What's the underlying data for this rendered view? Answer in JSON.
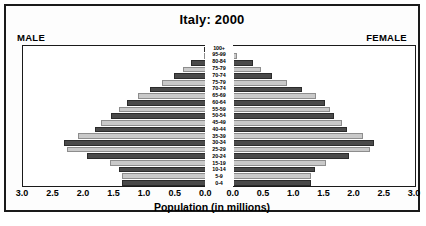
{
  "chart": {
    "title": "Italy: 2000",
    "male_label": "MALE",
    "female_label": "FEMALE",
    "xaxis_title": "Population (in millions)"
  },
  "chart_data": {
    "type": "bar",
    "subtype": "population-pyramid",
    "title": "Italy: 2000",
    "xlabel": "Population (in millions)",
    "ylabel": "",
    "xlim": [
      0,
      3.0
    ],
    "xtick_labels_left": [
      "3.0",
      "2.5",
      "2.0",
      "1.5",
      "1.0",
      "0.5",
      "0.0"
    ],
    "xtick_labels_right": [
      "0.0",
      "0.5",
      "1.0",
      "1.5",
      "2.0",
      "2.5",
      "3.0"
    ],
    "xtick_values": [
      3.0,
      2.5,
      2.0,
      1.5,
      1.0,
      0.5,
      0.0
    ],
    "grid": false,
    "legend": "none",
    "colors": {
      "dark_bar": "#4a4a4a",
      "light_bar": "#c9c9c9",
      "frame": "#1a1a1a",
      "background": "#ffffff"
    },
    "categories": [
      "100+",
      "95-99",
      "80-84",
      "75-79",
      "70-74",
      "75-79",
      "70-74",
      "65-69",
      "60-64",
      "55-59",
      "50-54",
      "45-49",
      "40-44",
      "35-39",
      "30-34",
      "25-29",
      "20-24",
      "15-19",
      "10-14",
      "5-9",
      "0-4"
    ],
    "series": [
      {
        "name": "Male",
        "side": "left",
        "values": [
          0.01,
          0.04,
          0.24,
          0.37,
          0.52,
          0.72,
          0.92,
          1.12,
          1.3,
          1.42,
          1.55,
          1.72,
          1.82,
          2.1,
          2.32,
          2.28,
          1.95,
          1.58,
          1.42,
          1.38,
          1.37
        ]
      },
      {
        "name": "Female",
        "side": "right",
        "values": [
          0.02,
          0.08,
          0.35,
          0.48,
          0.66,
          0.9,
          1.15,
          1.38,
          1.52,
          1.6,
          1.68,
          1.8,
          1.88,
          2.14,
          2.33,
          2.26,
          1.92,
          1.54,
          1.36,
          1.3,
          1.3
        ]
      }
    ]
  }
}
